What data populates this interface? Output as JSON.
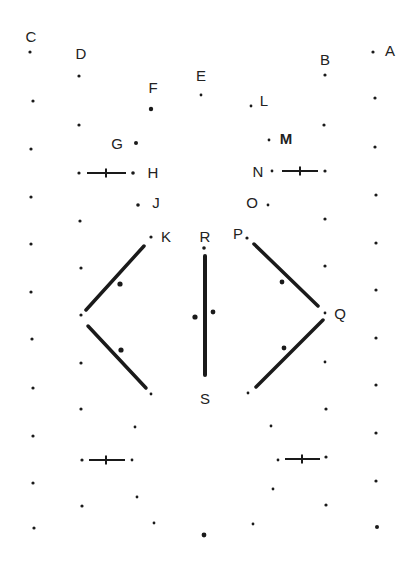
{
  "colors": {
    "ink": "#1a1a1a",
    "label": "#222222",
    "background": "#ffffff"
  },
  "labels": [
    {
      "text": "C",
      "x": 31,
      "y": 36
    },
    {
      "text": "D",
      "x": 81,
      "y": 53
    },
    {
      "text": "F",
      "x": 153,
      "y": 87
    },
    {
      "text": "E",
      "x": 201,
      "y": 75
    },
    {
      "text": "L",
      "x": 264,
      "y": 100
    },
    {
      "text": "B",
      "x": 325,
      "y": 59
    },
    {
      "text": "A",
      "x": 390,
      "y": 50
    },
    {
      "text": "G",
      "x": 117,
      "y": 143
    },
    {
      "text": "M",
      "x": 286,
      "y": 138,
      "bold": true
    },
    {
      "text": "H",
      "x": 153,
      "y": 172
    },
    {
      "text": "N",
      "x": 258,
      "y": 171
    },
    {
      "text": "J",
      "x": 156,
      "y": 202
    },
    {
      "text": "O",
      "x": 252,
      "y": 202
    },
    {
      "text": "K",
      "x": 166,
      "y": 236
    },
    {
      "text": "R",
      "x": 205,
      "y": 236
    },
    {
      "text": "P",
      "x": 238,
      "y": 233
    },
    {
      "text": "Q",
      "x": 340,
      "y": 313
    },
    {
      "text": "S",
      "x": 205,
      "y": 398
    }
  ],
  "dots": [
    {
      "x": 30,
      "y": 52,
      "r": 1.6
    },
    {
      "x": 33,
      "y": 101,
      "r": 1.6
    },
    {
      "x": 31,
      "y": 149,
      "r": 1.6
    },
    {
      "x": 31,
      "y": 197,
      "r": 1.6
    },
    {
      "x": 31,
      "y": 244,
      "r": 1.6
    },
    {
      "x": 31,
      "y": 292,
      "r": 1.6
    },
    {
      "x": 32,
      "y": 339,
      "r": 1.6
    },
    {
      "x": 33,
      "y": 388,
      "r": 1.6
    },
    {
      "x": 33,
      "y": 436,
      "r": 1.6
    },
    {
      "x": 33,
      "y": 483,
      "r": 1.6
    },
    {
      "x": 34,
      "y": 528,
      "r": 1.6
    },
    {
      "x": 79,
      "y": 76,
      "r": 1.6
    },
    {
      "x": 79,
      "y": 125,
      "r": 1.6
    },
    {
      "x": 79,
      "y": 173,
      "r": 1.6
    },
    {
      "x": 80,
      "y": 221,
      "r": 1.6
    },
    {
      "x": 81,
      "y": 268,
      "r": 1.6
    },
    {
      "x": 81,
      "y": 315,
      "r": 1.6
    },
    {
      "x": 81,
      "y": 363,
      "r": 1.6
    },
    {
      "x": 81,
      "y": 409,
      "r": 1.6
    },
    {
      "x": 82,
      "y": 460,
      "r": 1.6
    },
    {
      "x": 82,
      "y": 506,
      "r": 1.6
    },
    {
      "x": 151,
      "y": 109,
      "r": 2.2
    },
    {
      "x": 201,
      "y": 95,
      "r": 1.4
    },
    {
      "x": 251,
      "y": 106,
      "r": 1.4
    },
    {
      "x": 136,
      "y": 143,
      "r": 2.0
    },
    {
      "x": 269,
      "y": 140,
      "r": 1.4
    },
    {
      "x": 133,
      "y": 173,
      "r": 1.8
    },
    {
      "x": 272,
      "y": 171,
      "r": 1.4
    },
    {
      "x": 138,
      "y": 205,
      "r": 1.8
    },
    {
      "x": 268,
      "y": 205,
      "r": 1.4
    },
    {
      "x": 151,
      "y": 237,
      "r": 1.6
    },
    {
      "x": 204,
      "y": 248,
      "r": 1.8
    },
    {
      "x": 247,
      "y": 238,
      "r": 1.6
    },
    {
      "x": 120,
      "y": 284,
      "r": 2.6
    },
    {
      "x": 195,
      "y": 317,
      "r": 2.6
    },
    {
      "x": 213,
      "y": 312,
      "r": 2.4
    },
    {
      "x": 282,
      "y": 282,
      "r": 2.4
    },
    {
      "x": 121,
      "y": 350,
      "r": 2.6
    },
    {
      "x": 284,
      "y": 348,
      "r": 2.4
    },
    {
      "x": 325,
      "y": 313,
      "r": 1.4
    },
    {
      "x": 325,
      "y": 362,
      "r": 1.4
    },
    {
      "x": 151,
      "y": 394,
      "r": 1.4
    },
    {
      "x": 248,
      "y": 393,
      "r": 1.4
    },
    {
      "x": 135,
      "y": 427,
      "r": 1.4
    },
    {
      "x": 271,
      "y": 426,
      "r": 1.4
    },
    {
      "x": 132,
      "y": 460,
      "r": 1.4
    },
    {
      "x": 278,
      "y": 460,
      "r": 1.4
    },
    {
      "x": 137,
      "y": 497,
      "r": 1.4
    },
    {
      "x": 273,
      "y": 489,
      "r": 1.4
    },
    {
      "x": 154,
      "y": 523,
      "r": 1.4
    },
    {
      "x": 253,
      "y": 524,
      "r": 1.4
    },
    {
      "x": 204,
      "y": 535,
      "r": 2.4
    },
    {
      "x": 325,
      "y": 75,
      "r": 1.6
    },
    {
      "x": 324,
      "y": 125,
      "r": 1.6
    },
    {
      "x": 325,
      "y": 171,
      "r": 1.6
    },
    {
      "x": 325,
      "y": 219,
      "r": 1.6
    },
    {
      "x": 325,
      "y": 266,
      "r": 1.6
    },
    {
      "x": 326,
      "y": 409,
      "r": 1.6
    },
    {
      "x": 326,
      "y": 457,
      "r": 1.6
    },
    {
      "x": 326,
      "y": 505,
      "r": 1.6
    },
    {
      "x": 373,
      "y": 52,
      "r": 1.6
    },
    {
      "x": 375,
      "y": 98,
      "r": 1.6
    },
    {
      "x": 375,
      "y": 147,
      "r": 1.6
    },
    {
      "x": 376,
      "y": 195,
      "r": 1.6
    },
    {
      "x": 376,
      "y": 243,
      "r": 1.6
    },
    {
      "x": 376,
      "y": 290,
      "r": 1.6
    },
    {
      "x": 376,
      "y": 338,
      "r": 1.6
    },
    {
      "x": 376,
      "y": 385,
      "r": 1.6
    },
    {
      "x": 376,
      "y": 433,
      "r": 1.6
    },
    {
      "x": 376,
      "y": 481,
      "r": 1.6
    },
    {
      "x": 377,
      "y": 527,
      "r": 2.0
    }
  ],
  "thick_lines": [
    {
      "x1": 144,
      "y1": 246,
      "x2": 86,
      "y2": 310,
      "w": 3.5
    },
    {
      "x1": 88,
      "y1": 326,
      "x2": 146,
      "y2": 388,
      "w": 3.5
    },
    {
      "x1": 205,
      "y1": 256,
      "x2": 205,
      "y2": 375,
      "w": 4
    },
    {
      "x1": 254,
      "y1": 244,
      "x2": 318,
      "y2": 306,
      "w": 3.5
    },
    {
      "x1": 323,
      "y1": 320,
      "x2": 256,
      "y2": 387,
      "w": 3.5
    }
  ],
  "crosses": [
    {
      "x1": 87,
      "x2": 126,
      "y": 173,
      "cx": 106,
      "ch": 7
    },
    {
      "x1": 282,
      "x2": 318,
      "y": 171,
      "cx": 300,
      "ch": 7
    },
    {
      "x1": 89,
      "x2": 125,
      "y": 460,
      "cx": 106,
      "ch": 7
    },
    {
      "x1": 285,
      "x2": 320,
      "y": 459,
      "cx": 302,
      "ch": 7
    }
  ]
}
